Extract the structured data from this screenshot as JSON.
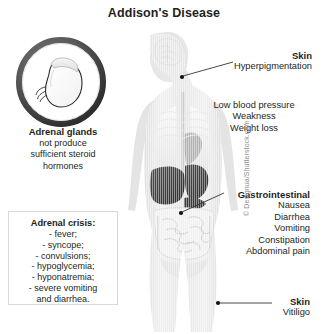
{
  "title": "Addison's Disease",
  "gland": {
    "heading": "Adrenal glands",
    "line1": "not produce",
    "line2": "sufficient steroid",
    "line3": "hormones",
    "icon": "adrenal-gland-kidney-icon"
  },
  "crisis": {
    "heading": "Adrenal crisis:",
    "items": [
      "- fever;",
      "- syncope;",
      "- convulsions;",
      "- hypoglycemia;",
      "- hyponatremia;",
      "- severe vomiting",
      "and diarrhea."
    ]
  },
  "labels": {
    "skin_top": {
      "heading": "Skin",
      "line1": "Hyperpigmentation"
    },
    "vitals": {
      "line1": "Low blood pressure",
      "line2": "Weakness",
      "line3": "Weight loss"
    },
    "gastrointestinal": {
      "heading": "Gastrointestinal",
      "line1": "Nausea",
      "line2": "Diarrhea",
      "line3": "Vomiting",
      "line4": "Constipation",
      "line5": "Abdominal pain"
    },
    "skin_bottom": {
      "heading": "Skin",
      "line1": "Vitiligo"
    }
  },
  "figure": {
    "alt": "human-body-anatomy-silhouette"
  },
  "credit": "© Designua/Shutterstock.com",
  "colors": {
    "background": "#ffffff",
    "text": "#231f20",
    "body_fill": "#e9e9e9",
    "ring": "#4a4a4a",
    "organ_dark": "#3a3a3a",
    "box_border": "#d9d9d9",
    "leader": "#333333",
    "credit": "#8d8d8d"
  }
}
